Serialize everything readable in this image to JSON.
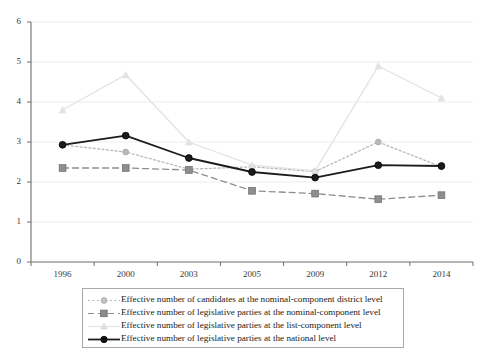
{
  "chart_data": {
    "type": "line",
    "title": "",
    "subtitle": "",
    "xlabel": "",
    "ylabel": "",
    "categories": [
      "1996",
      "2000",
      "2003",
      "2005",
      "2009",
      "2012",
      "2014"
    ],
    "x_tick_labels": [
      "1996",
      "2000",
      "2003",
      "2005",
      "2009",
      "2012",
      "2014"
    ],
    "y_tick_labels": [
      "0",
      "1",
      "2",
      "3",
      "4",
      "5",
      "6"
    ],
    "y_ticks": [
      0,
      1,
      2,
      3,
      4,
      5,
      6
    ],
    "ylim": [
      0,
      6
    ],
    "grid": "horizontal",
    "legend_position": "bottom",
    "series": [
      {
        "name": "Effective number of candidates at the nominal-component district level",
        "values": [
          2.93,
          2.75,
          2.32,
          2.38,
          2.26,
          3.0,
          2.38
        ],
        "color": "#b9b9b9",
        "line_style": "dotted",
        "marker": "circle"
      },
      {
        "name": "Effective number of legislative parties at the nominal-component level",
        "values": [
          2.35,
          2.35,
          2.3,
          1.78,
          1.71,
          1.57,
          1.67
        ],
        "color": "#8e8e8e",
        "line_style": "dashed",
        "marker": "square"
      },
      {
        "name": "Effective number of legislative parties at the list-component level",
        "values": [
          3.8,
          4.68,
          3.0,
          2.42,
          2.28,
          4.9,
          4.1
        ],
        "color": "#e2e2e2",
        "line_style": "solid",
        "marker": "triangle"
      },
      {
        "name": "Effective number of legislative parties at the national level",
        "values": [
          2.93,
          3.16,
          2.6,
          2.25,
          2.11,
          2.42,
          2.4
        ],
        "color": "#1c1c1c",
        "line_style": "solid",
        "marker": "circle"
      }
    ]
  },
  "legend": {
    "items": [
      {
        "label": "Effective number of candidates at the nominal-component district level"
      },
      {
        "label": "Effective number of legislative parties at the nominal-component level"
      },
      {
        "label": "Effective number of legislative parties at the list-component level"
      },
      {
        "label": "Effective number of legislative parties at the national level"
      }
    ]
  }
}
